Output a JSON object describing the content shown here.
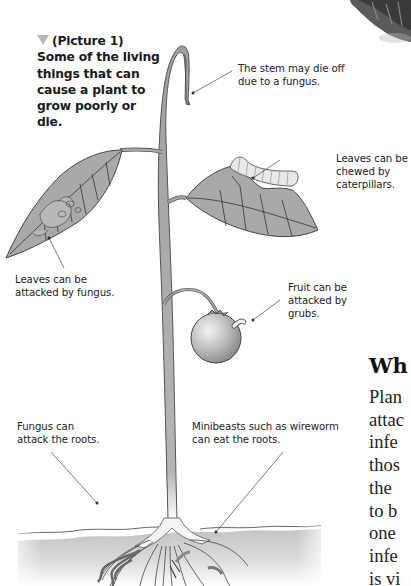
{
  "figure": {
    "caption_marker_icon": "triangle-down-icon",
    "caption": "(Picture 1) Some of the living things that can cause a plant to grow poorly or die.",
    "labels": {
      "stem": "The stem may die off due to a fungus.",
      "caterpillar": "Leaves can be chewed by caterpillars.",
      "leaf_fungus": "Leaves can be attacked by fungus.",
      "fruit": "Fruit can be attacked by grubs.",
      "root_fungus": "Fungus can attack the roots.",
      "wireworm": "Minibeasts such as wireworm can eat the roots."
    }
  },
  "article": {
    "heading_partial": "Wh",
    "body_lines_partial": [
      "Plan",
      "attac",
      "infe",
      "thos",
      "the",
      "to b",
      "one",
      "infe",
      "is vi"
    ]
  },
  "colors": {
    "leaf": "#a9a9a9",
    "stem": "#9a9a9a",
    "soil_top": "#c8c8c8",
    "text": "#222222"
  }
}
